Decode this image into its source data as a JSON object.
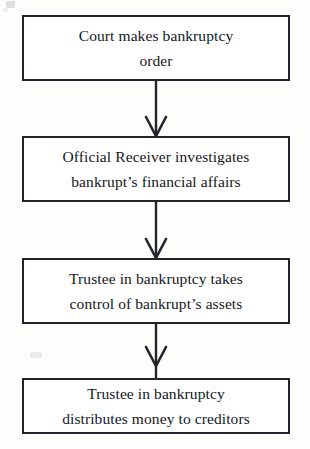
{
  "diagram": {
    "type": "flowchart",
    "orientation": "vertical-top-to-bottom",
    "background_color": "#fdfdfc",
    "line_color": "#23232b",
    "text_color": "#16161c",
    "nodes": [
      {
        "id": "node-1",
        "name": "court-makes-bankruptcy-order",
        "label": "Court makes bankruptcy\norder",
        "shape": "rectangle"
      },
      {
        "id": "node-2",
        "name": "official-receiver-investigates",
        "label": "Official Receiver investigates\nbankrupt’s financial affairs",
        "shape": "rectangle"
      },
      {
        "id": "node-3",
        "name": "trustee-takes-control-of-assets",
        "label": "Trustee in bankruptcy takes\ncontrol of bankrupt’s assets",
        "shape": "rectangle"
      },
      {
        "id": "node-4",
        "name": "trustee-distributes-money",
        "label": "Trustee in bankruptcy\ndistributes money to creditors",
        "shape": "rectangle"
      }
    ],
    "connectors": [
      {
        "id": "connector-1",
        "from": "node-1",
        "to": "node-2",
        "style": "arrow-down"
      },
      {
        "id": "connector-2",
        "from": "node-2",
        "to": "node-3",
        "style": "arrow-down"
      },
      {
        "id": "connector-3",
        "from": "node-3",
        "to": "node-4",
        "style": "arrow-down"
      }
    ]
  }
}
